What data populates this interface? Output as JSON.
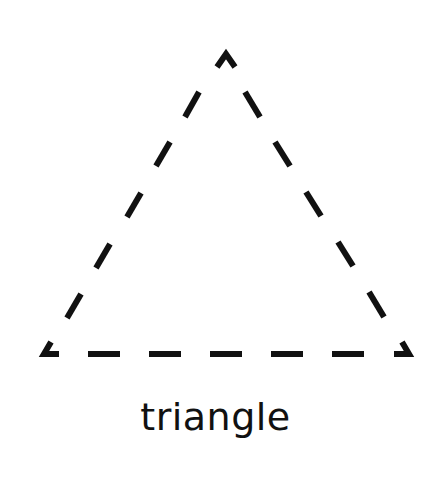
{
  "shape": {
    "name": "triangle",
    "style": "dashed outline",
    "stroke_color": "#111111",
    "background_color": "#ffffff",
    "vertices": {
      "apex": [
        226,
        55
      ],
      "bottom_left": [
        44,
        354
      ],
      "bottom_right": [
        409,
        354
      ]
    }
  },
  "caption": {
    "text": "triangle"
  }
}
